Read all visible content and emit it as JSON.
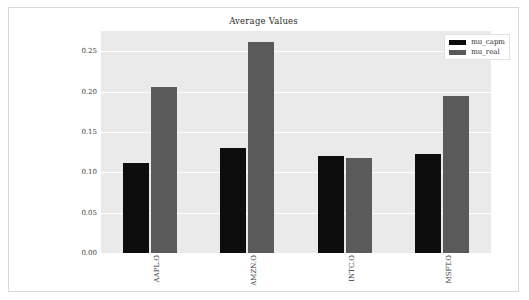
{
  "chart_data": {
    "type": "bar",
    "title": "Average Values",
    "xlabel": "",
    "ylabel": "",
    "categories": [
      "AAPL.O",
      "AMZN.O",
      "INTC.O",
      "MSFT.O"
    ],
    "series": [
      {
        "name": "mu_capm",
        "color": "#0d0d0d",
        "values": [
          0.111,
          0.13,
          0.12,
          0.123
        ]
      },
      {
        "name": "mu_real",
        "color": "#5a5a5a",
        "values": [
          0.206,
          0.261,
          0.118,
          0.195
        ]
      }
    ],
    "ylim": [
      0.0,
      0.275
    ],
    "yticks": [
      "0.00",
      "0.05",
      "0.10",
      "0.15",
      "0.20",
      "0.25"
    ],
    "ytick_values": [
      0.0,
      0.05,
      0.1,
      0.15,
      0.2,
      0.25
    ],
    "grid": true,
    "legend_position": "upper right",
    "plot_background": "#eaeaea",
    "figure_background": "#ffffff"
  },
  "legend": {
    "entries": [
      {
        "label": "mu_capm"
      },
      {
        "label": "mu_real"
      }
    ]
  }
}
